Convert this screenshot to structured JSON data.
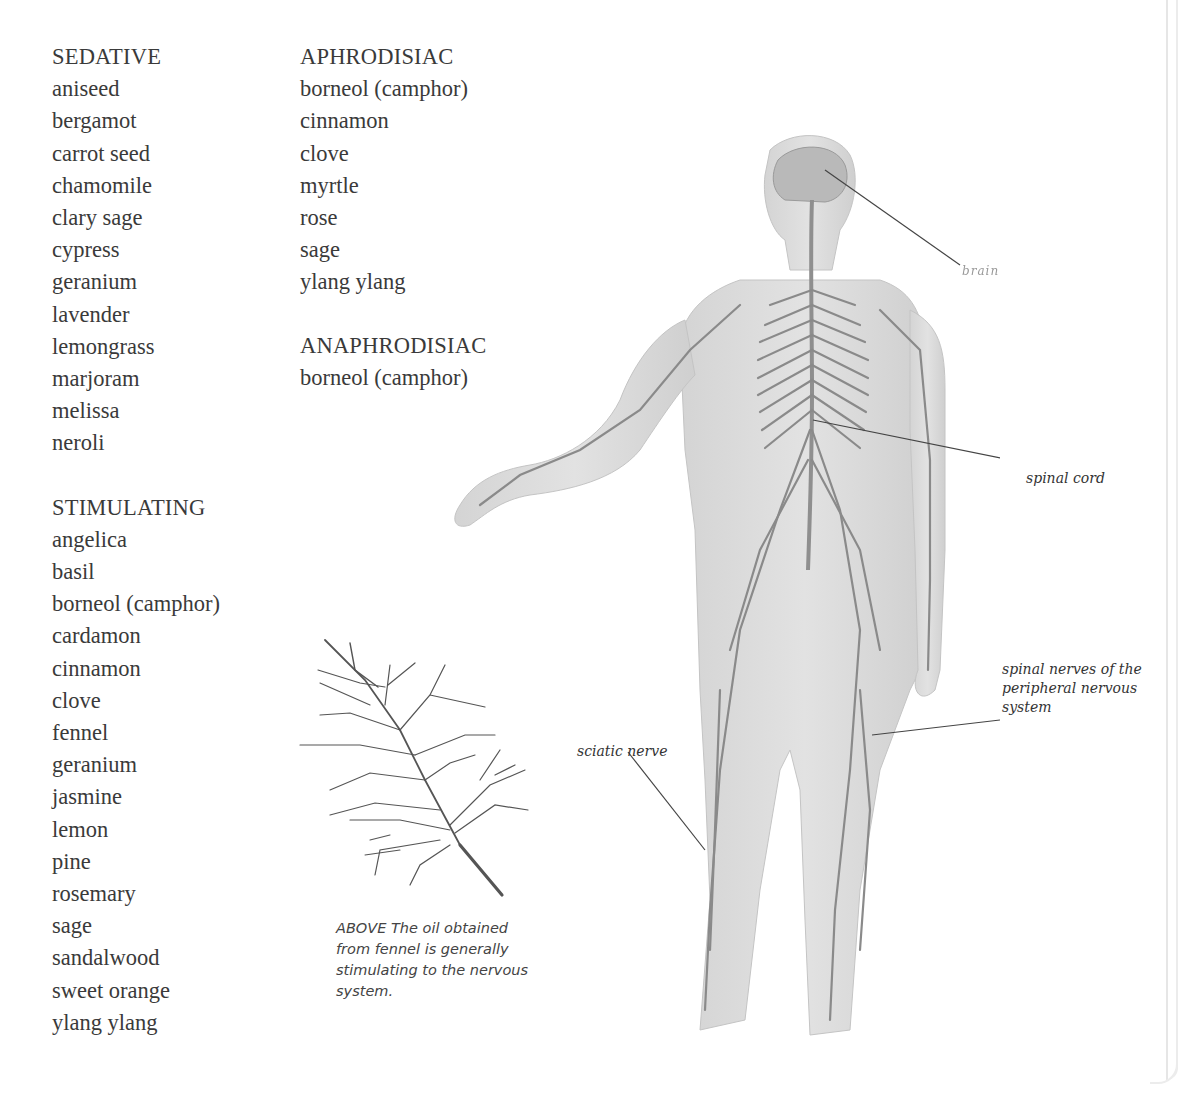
{
  "columns": {
    "left": [
      {
        "heading": "SEDATIVE",
        "items": [
          "aniseed",
          "bergamot",
          "carrot seed",
          "chamomile",
          "clary sage",
          "cypress",
          "geranium",
          "lavender",
          "lemongrass",
          "marjoram",
          "melissa",
          "neroli"
        ]
      },
      {
        "heading": "STIMULATING",
        "items": [
          "angelica",
          "basil",
          "borneol (camphor)",
          "cardamon",
          "cinnamon",
          "clove",
          "fennel",
          "geranium",
          "jasmine",
          "lemon",
          "pine",
          "rosemary",
          "sage",
          "sandalwood",
          "sweet orange",
          "ylang ylang"
        ]
      }
    ],
    "middle": [
      {
        "heading": "APHRODISIAC",
        "items": [
          "borneol (camphor)",
          "cinnamon",
          "clove",
          "myrtle",
          "rose",
          "sage",
          "ylang ylang"
        ]
      },
      {
        "heading": "ANAPHRODISIAC",
        "items": [
          "borneol (camphor)"
        ]
      }
    ]
  },
  "figure": {
    "labels": {
      "brain": "brain",
      "spinal_cord": "spinal cord",
      "spinal_nerves": "spinal nerves of the peripheral nervous system",
      "sciatic_nerve": "sciatic nerve"
    },
    "colors": {
      "skin": "#d9d9d9",
      "nerve": "#8a8a8a",
      "leader_line": "#444444"
    }
  },
  "caption": {
    "text": "ABOVE The oil obtained from fennel is generally stimulating to the nervous system."
  }
}
